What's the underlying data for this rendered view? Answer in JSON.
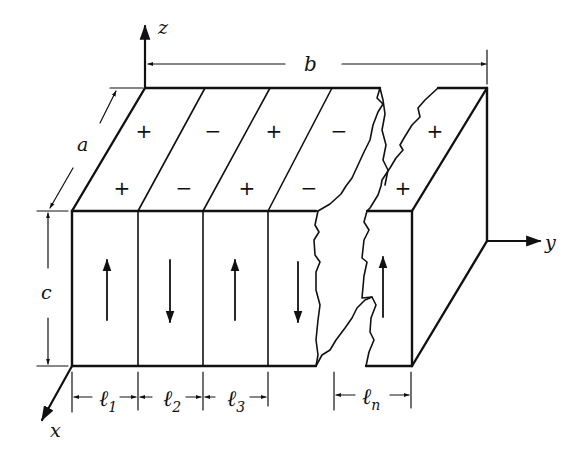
{
  "diagram": {
    "axes": {
      "x": "x",
      "y": "y",
      "z": "z"
    },
    "dimensions": {
      "a": "a",
      "b": "b",
      "c": "c"
    },
    "domain_widths": [
      {
        "label": "ℓ",
        "sub": "1"
      },
      {
        "label": "ℓ",
        "sub": "2"
      },
      {
        "label": "ℓ",
        "sub": "3"
      },
      {
        "label": "ℓ",
        "sub": "n"
      }
    ],
    "top_signs_back": [
      "+",
      "−",
      "+",
      "−",
      "+"
    ],
    "top_signs_front": [
      "+",
      "−",
      "+",
      "−",
      "+"
    ],
    "front_arrows": [
      "up",
      "down",
      "up",
      "down",
      "up"
    ]
  }
}
